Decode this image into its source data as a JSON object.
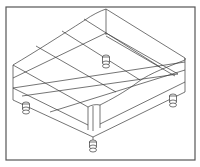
{
  "figure": {
    "type": "isometric-wireframe",
    "line_color": "#3a3a3a",
    "frame_color": "#555555",
    "background": "#ffffff",
    "frame": {
      "x": 6,
      "y": 7,
      "width": 189,
      "height": 153
    },
    "feet": [
      {
        "name": "back-foot",
        "cx": 106,
        "cy": 60
      },
      {
        "name": "left-foot",
        "cx": 26,
        "cy": 107
      },
      {
        "name": "right-foot",
        "cx": 173,
        "cy": 100
      },
      {
        "name": "front-foot",
        "cx": 93,
        "cy": 146
      }
    ]
  }
}
